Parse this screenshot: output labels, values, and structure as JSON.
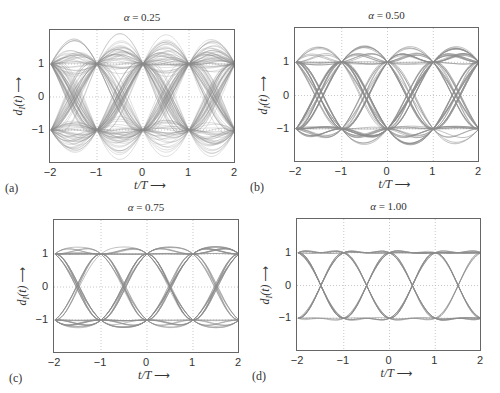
{
  "figure": {
    "line_color": "#8c8c8c",
    "grid_color": "#bbbbbb",
    "panels": [
      {
        "id": "a",
        "label": "(a)",
        "title_symbol": "α",
        "title_value": "= 0.25",
        "alpha": 0.25,
        "box": {
          "left": 49,
          "top": 29,
          "right": 235,
          "bottom": 163
        },
        "xlabel": "t/T",
        "ylabel": "dI(t)",
        "arrow": "⟶"
      },
      {
        "id": "b",
        "label": "(b)",
        "title_symbol": "α",
        "title_value": "= 0.50",
        "alpha": 0.5,
        "box": {
          "left": 294,
          "top": 27,
          "right": 479,
          "bottom": 162
        },
        "xlabel": "t/T",
        "ylabel": "dI(t)",
        "arrow": "⟶"
      },
      {
        "id": "c",
        "label": "(c)",
        "title_symbol": "α",
        "title_value": "= 0.75",
        "alpha": 0.75,
        "box": {
          "left": 53,
          "top": 219,
          "right": 239,
          "bottom": 353
        },
        "xlabel": "t/T",
        "ylabel": "dI(t)",
        "arrow": "⟶"
      },
      {
        "id": "d",
        "label": "(d)",
        "title_symbol": "α",
        "title_value": "= 1.00",
        "alpha": 1.0,
        "box": {
          "left": 296,
          "top": 218,
          "right": 481,
          "bottom": 351
        },
        "xlabel": "t/T",
        "ylabel": "dI(t)",
        "arrow": "⟶"
      }
    ]
  },
  "chart_data": [
    {
      "type": "line",
      "title": "α = 0.25",
      "subtitle": "(a)",
      "xlabel": "t/T →",
      "ylabel": "d_I(t) →",
      "xlim": [
        -2,
        2
      ],
      "ylim": [
        -2,
        2
      ],
      "xticks": [
        -2,
        -1,
        0,
        1,
        2
      ],
      "yticks": [
        -1,
        0,
        1
      ],
      "grid": true,
      "rolloff": 0.25,
      "description": "Eye diagram of raised-cosine filtered binary signal; eye openings centered at t/T=-1.5,-0.5,0.5,1.5; peak overshoot ≈ ±1.75"
    },
    {
      "type": "line",
      "title": "α = 0.50",
      "subtitle": "(b)",
      "xlabel": "t/T →",
      "ylabel": "d_I(t) →",
      "xlim": [
        -2,
        2
      ],
      "ylim": [
        -2,
        2
      ],
      "xticks": [
        -2,
        -1,
        0,
        1,
        2
      ],
      "yticks": [
        -1,
        0,
        1
      ],
      "grid": true,
      "rolloff": 0.5,
      "description": "Eye diagram; peak overshoot ≈ ±1.45"
    },
    {
      "type": "line",
      "title": "α = 0.75",
      "subtitle": "(c)",
      "xlabel": "t/T →",
      "ylabel": "d_I(t) →",
      "xlim": [
        -2,
        2
      ],
      "ylim": [
        -2,
        2
      ],
      "xticks": [
        -2,
        -1,
        0,
        1,
        2
      ],
      "yticks": [
        -1,
        0,
        1
      ],
      "grid": true,
      "rolloff": 0.75,
      "description": "Eye diagram; peak overshoot ≈ ±1.2"
    },
    {
      "type": "line",
      "title": "α = 1.00",
      "subtitle": "(d)",
      "xlabel": "t/T →",
      "ylabel": "d_I(t) →",
      "xlim": [
        -2,
        2
      ],
      "ylim": [
        -2,
        2
      ],
      "xticks": [
        -2,
        -1,
        0,
        1,
        2
      ],
      "yticks": [
        -1,
        0,
        1
      ],
      "grid": true,
      "rolloff": 1.0,
      "description": "Eye diagram; wide open eye, overshoot ≈ ±1.05"
    }
  ],
  "ticks": {
    "x": [
      "−2",
      "−1",
      "0",
      "1",
      "2"
    ],
    "y": [
      "1",
      "0",
      "−1"
    ]
  }
}
